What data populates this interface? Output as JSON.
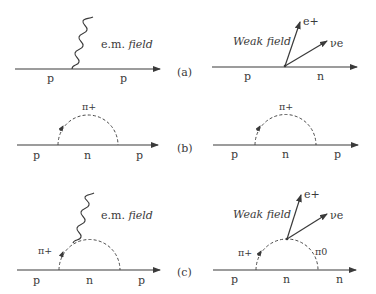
{
  "figure": {
    "panels": [
      {
        "id": "a",
        "label": "(a)",
        "left": {
          "field_label_prefix": "e.m. ",
          "field_label_italic": "field",
          "incoming": "p",
          "outgoing": "p"
        },
        "right": {
          "field_label": "Weak field",
          "incoming": "p",
          "outgoing": "n",
          "emitted_1": "e+",
          "emitted_2": "νe"
        }
      },
      {
        "id": "b",
        "label": "(b)",
        "left": {
          "loop_particle": "π+",
          "incoming": "p",
          "internal": "n",
          "outgoing": "p"
        },
        "right": {
          "loop_particle": "π+",
          "incoming": "p",
          "internal": "n",
          "outgoing": "p"
        }
      },
      {
        "id": "c",
        "label": "(c)",
        "left": {
          "field_label_prefix": "e.m. ",
          "field_label_italic": "field",
          "loop_particle": "π+",
          "incoming": "p",
          "internal": "n",
          "outgoing": "p"
        },
        "right": {
          "field_label": "Weak field",
          "loop_particle_left": "π+",
          "loop_particle_right": "π0",
          "incoming": "p",
          "internal": "n",
          "outgoing": "n",
          "emitted_1": "e+",
          "emitted_2": "νe"
        }
      }
    ]
  }
}
